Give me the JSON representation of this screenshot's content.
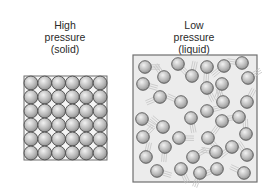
{
  "left": {
    "title_line1": "High",
    "title_line2": "pressure",
    "title_line3": "(solid)",
    "grid_cols": 6,
    "grid_rows": 6
  },
  "right": {
    "title_line1": "Low",
    "title_line2": "pressure",
    "title_line3": "(liquid)",
    "particles": [
      [
        145,
        67
      ],
      [
        178,
        64
      ],
      [
        207,
        67
      ],
      [
        224,
        66
      ],
      [
        242,
        63
      ],
      [
        164,
        77
      ],
      [
        192,
        76
      ],
      [
        248,
        78
      ],
      [
        143,
        84
      ],
      [
        207,
        88
      ],
      [
        222,
        84
      ],
      [
        160,
        97
      ],
      [
        181,
        102
      ],
      [
        223,
        102
      ],
      [
        247,
        102
      ],
      [
        207,
        111
      ],
      [
        142,
        119
      ],
      [
        191,
        118
      ],
      [
        222,
        121
      ],
      [
        239,
        117
      ],
      [
        163,
        127
      ],
      [
        246,
        134
      ],
      [
        143,
        137
      ],
      [
        179,
        138
      ],
      [
        208,
        138
      ],
      [
        165,
        147
      ],
      [
        232,
        147
      ],
      [
        216,
        152
      ],
      [
        247,
        155
      ],
      [
        146,
        157
      ],
      [
        193,
        157
      ],
      [
        157,
        171
      ],
      [
        181,
        169
      ],
      [
        200,
        173
      ],
      [
        217,
        169
      ],
      [
        244,
        173
      ]
    ]
  },
  "colors": {
    "box_fill": "#ececec",
    "box_border": "#6f6f6f",
    "particle_light": "#e8e8e8",
    "particle_dark": "#8a8a8a",
    "particle_stroke": "#555555",
    "text": "#2a2a2a"
  }
}
